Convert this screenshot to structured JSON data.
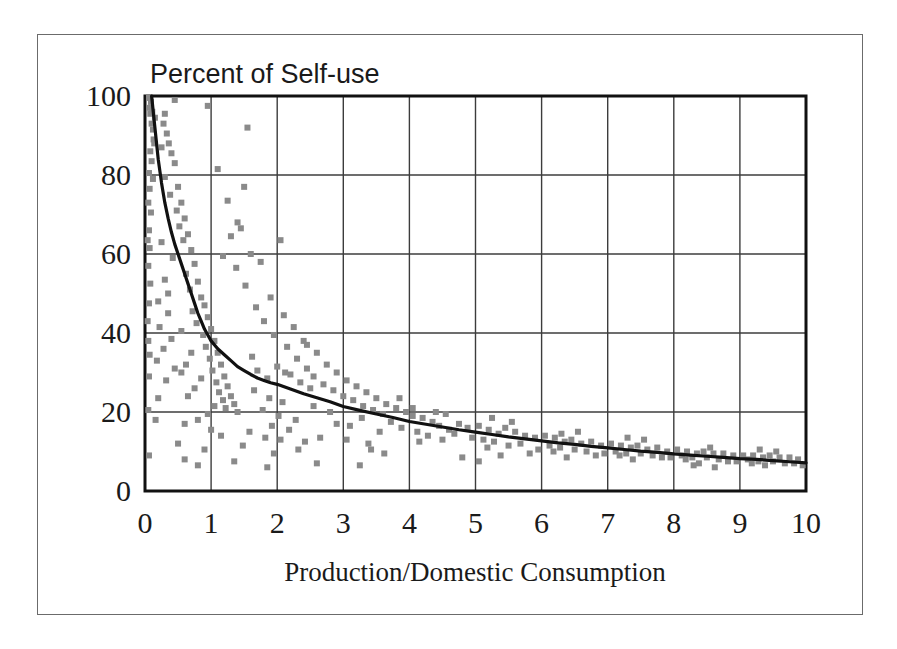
{
  "figure": {
    "background_color": "#ffffff",
    "frame_color": "#6b6b6b"
  },
  "chart_data": {
    "type": "scatter",
    "title": "Percent of Self-use",
    "xlabel": "Production/Domestic Consumption",
    "ylabel": "",
    "xlim": [
      0,
      10
    ],
    "ylim": [
      0,
      100
    ],
    "xticks": [
      "0",
      "1",
      "2",
      "3",
      "4",
      "5",
      "6",
      "7",
      "8",
      "9",
      "10"
    ],
    "yticks": [
      "0",
      "20",
      "40",
      "60",
      "80",
      "100"
    ],
    "grid": true,
    "legend": "none",
    "marker": {
      "shape": "square",
      "color": "#8a8a8a",
      "size_px": 6
    },
    "fit_curve": {
      "label": "power-law fit",
      "color": "#111111",
      "width_px": 3.2,
      "description": "Percent = 100 when Production/Domestic Consumption is near 0.1, decreasing to about 7 at 10",
      "points": [
        [
          0.1,
          100.0
        ],
        [
          0.15,
          92.0
        ],
        [
          0.2,
          84.0
        ],
        [
          0.25,
          78.0
        ],
        [
          0.3,
          73.0
        ],
        [
          0.35,
          69.0
        ],
        [
          0.4,
          65.5
        ],
        [
          0.45,
          62.5
        ],
        [
          0.5,
          60.0
        ],
        [
          0.55,
          57.5
        ],
        [
          0.6,
          55.0
        ],
        [
          0.65,
          52.5
        ],
        [
          0.7,
          50.0
        ],
        [
          0.75,
          47.5
        ],
        [
          0.8,
          45.0
        ],
        [
          0.85,
          43.0
        ],
        [
          0.9,
          41.0
        ],
        [
          0.95,
          39.5
        ],
        [
          1.0,
          38.0
        ],
        [
          1.1,
          36.0
        ],
        [
          1.2,
          34.5
        ],
        [
          1.3,
          33.0
        ],
        [
          1.4,
          31.5
        ],
        [
          1.5,
          30.5
        ],
        [
          1.6,
          29.5
        ],
        [
          1.7,
          28.6
        ],
        [
          1.8,
          28.0
        ],
        [
          1.9,
          27.4
        ],
        [
          2.0,
          27.0
        ],
        [
          2.2,
          25.8
        ],
        [
          2.4,
          24.6
        ],
        [
          2.6,
          23.6
        ],
        [
          2.8,
          22.6
        ],
        [
          3.0,
          21.4
        ],
        [
          3.25,
          20.4
        ],
        [
          3.5,
          19.5
        ],
        [
          3.75,
          18.6
        ],
        [
          4.0,
          17.6
        ],
        [
          4.25,
          16.9
        ],
        [
          4.5,
          16.2
        ],
        [
          4.75,
          15.5
        ],
        [
          5.0,
          14.9
        ],
        [
          5.25,
          14.3
        ],
        [
          5.5,
          13.7
        ],
        [
          5.75,
          13.2
        ],
        [
          6.0,
          12.7
        ],
        [
          6.25,
          12.2
        ],
        [
          6.5,
          11.8
        ],
        [
          6.75,
          11.3
        ],
        [
          7.0,
          10.9
        ],
        [
          7.25,
          10.5
        ],
        [
          7.5,
          10.1
        ],
        [
          7.75,
          9.8
        ],
        [
          8.0,
          9.4
        ],
        [
          8.25,
          9.1
        ],
        [
          8.5,
          8.8
        ],
        [
          8.75,
          8.5
        ],
        [
          9.0,
          8.2
        ],
        [
          9.25,
          8.0
        ],
        [
          9.5,
          7.7
        ],
        [
          9.75,
          7.4
        ],
        [
          10.0,
          7.1
        ]
      ]
    },
    "points": [
      [
        0.06,
        99.5
      ],
      [
        0.07,
        97.0
      ],
      [
        0.08,
        95.5
      ],
      [
        0.09,
        98.5
      ],
      [
        0.1,
        93.0
      ],
      [
        0.11,
        96.0
      ],
      [
        0.12,
        91.5
      ],
      [
        0.13,
        89.0
      ],
      [
        0.08,
        86.0
      ],
      [
        0.14,
        88.0
      ],
      [
        0.1,
        83.5
      ],
      [
        0.06,
        80.5
      ],
      [
        0.12,
        79.0
      ],
      [
        0.07,
        76.5
      ],
      [
        0.05,
        73.0
      ],
      [
        0.09,
        70.5
      ],
      [
        0.06,
        66.0
      ],
      [
        0.04,
        63.5
      ],
      [
        0.07,
        61.5
      ],
      [
        0.05,
        57.0
      ],
      [
        0.08,
        52.5
      ],
      [
        0.06,
        47.5
      ],
      [
        0.04,
        43.0
      ],
      [
        0.05,
        38.0
      ],
      [
        0.07,
        34.5
      ],
      [
        0.06,
        29.0
      ],
      [
        0.05,
        20.5
      ],
      [
        0.06,
        9.0
      ],
      [
        0.3,
        95.5
      ],
      [
        0.28,
        93.0
      ],
      [
        0.33,
        90.5
      ],
      [
        0.36,
        88.0
      ],
      [
        0.25,
        87.0
      ],
      [
        0.4,
        85.5
      ],
      [
        0.45,
        83.0
      ],
      [
        0.3,
        79.5
      ],
      [
        0.5,
        77.0
      ],
      [
        0.38,
        75.0
      ],
      [
        0.55,
        73.0
      ],
      [
        0.48,
        71.0
      ],
      [
        0.6,
        69.0
      ],
      [
        0.52,
        67.0
      ],
      [
        0.65,
        65.0
      ],
      [
        0.58,
        63.5
      ],
      [
        0.7,
        61.0
      ],
      [
        0.42,
        59.0
      ],
      [
        0.75,
        57.5
      ],
      [
        0.62,
        55.0
      ],
      [
        0.8,
        53.0
      ],
      [
        0.68,
        51.0
      ],
      [
        0.85,
        49.0
      ],
      [
        0.9,
        47.0
      ],
      [
        0.72,
        45.5
      ],
      [
        0.95,
        44.0
      ],
      [
        0.78,
        42.5
      ],
      [
        1.0,
        41.0
      ],
      [
        0.88,
        39.5
      ],
      [
        1.05,
        38.0
      ],
      [
        0.92,
        36.5
      ],
      [
        1.1,
        35.0
      ],
      [
        0.98,
        33.5
      ],
      [
        1.15,
        32.0
      ],
      [
        1.02,
        30.5
      ],
      [
        1.2,
        29.0
      ],
      [
        1.08,
        27.5
      ],
      [
        1.25,
        26.5
      ],
      [
        1.12,
        25.0
      ],
      [
        1.3,
        24.0
      ],
      [
        1.18,
        23.0
      ],
      [
        1.35,
        22.0
      ],
      [
        1.22,
        21.0
      ],
      [
        1.4,
        20.0
      ],
      [
        0.7,
        35.0
      ],
      [
        0.62,
        32.0
      ],
      [
        0.55,
        30.0
      ],
      [
        0.85,
        28.5
      ],
      [
        0.75,
        26.0
      ],
      [
        0.65,
        24.0
      ],
      [
        1.05,
        21.5
      ],
      [
        0.95,
        19.5
      ],
      [
        0.8,
        18.0
      ],
      [
        0.6,
        17.0
      ],
      [
        1.0,
        15.5
      ],
      [
        1.15,
        14.0
      ],
      [
        0.5,
        12.0
      ],
      [
        0.9,
        10.5
      ],
      [
        0.25,
        63.0
      ],
      [
        0.3,
        53.5
      ],
      [
        0.2,
        48.0
      ],
      [
        0.35,
        45.0
      ],
      [
        0.22,
        41.5
      ],
      [
        0.4,
        38.5
      ],
      [
        0.28,
        36.0
      ],
      [
        0.18,
        33.0
      ],
      [
        0.45,
        31.0
      ],
      [
        0.32,
        28.0
      ],
      [
        0.2,
        23.5
      ],
      [
        0.16,
        18.0
      ],
      [
        0.95,
        97.5
      ],
      [
        1.55,
        92.0
      ],
      [
        1.1,
        81.5
      ],
      [
        1.5,
        77.0
      ],
      [
        1.25,
        73.5
      ],
      [
        1.45,
        66.5
      ],
      [
        1.3,
        64.5
      ],
      [
        1.18,
        59.5
      ],
      [
        1.6,
        60.0
      ],
      [
        1.75,
        58.0
      ],
      [
        1.38,
        56.5
      ],
      [
        2.05,
        63.5
      ],
      [
        1.52,
        52.0
      ],
      [
        1.9,
        49.0
      ],
      [
        1.68,
        46.5
      ],
      [
        2.1,
        44.5
      ],
      [
        1.8,
        43.0
      ],
      [
        2.25,
        41.5
      ],
      [
        1.95,
        39.5
      ],
      [
        2.4,
        38.0
      ],
      [
        2.15,
        36.5
      ],
      [
        2.6,
        35.0
      ],
      [
        2.3,
        33.5
      ],
      [
        2.75,
        32.0
      ],
      [
        2.45,
        31.0
      ],
      [
        2.9,
        30.0
      ],
      [
        2.55,
        29.0
      ],
      [
        3.05,
        28.0
      ],
      [
        2.7,
        27.0
      ],
      [
        3.2,
        26.5
      ],
      [
        2.85,
        25.5
      ],
      [
        3.35,
        25.0
      ],
      [
        3.0,
        24.0
      ],
      [
        3.5,
        23.5
      ],
      [
        3.15,
        23.0
      ],
      [
        3.65,
        22.0
      ],
      [
        3.3,
        21.5
      ],
      [
        3.8,
        21.0
      ],
      [
        3.45,
        20.5
      ],
      [
        3.95,
        20.0
      ],
      [
        3.6,
        19.5
      ],
      [
        1.7,
        30.5
      ],
      [
        1.85,
        28.5
      ],
      [
        2.0,
        31.5
      ],
      [
        2.2,
        29.5
      ],
      [
        1.65,
        25.5
      ],
      [
        1.88,
        23.5
      ],
      [
        2.08,
        22.5
      ],
      [
        2.35,
        27.5
      ],
      [
        2.5,
        26.0
      ],
      [
        1.78,
        20.5
      ],
      [
        2.02,
        19.0
      ],
      [
        2.28,
        18.0
      ],
      [
        1.92,
        16.5
      ],
      [
        2.18,
        15.5
      ],
      [
        2.55,
        21.5
      ],
      [
        2.8,
        20.0
      ],
      [
        1.58,
        15.0
      ],
      [
        1.82,
        13.5
      ],
      [
        2.05,
        13.0
      ],
      [
        2.42,
        12.5
      ],
      [
        2.65,
        13.5
      ],
      [
        1.48,
        11.5
      ],
      [
        1.95,
        9.5
      ],
      [
        2.32,
        10.5
      ],
      [
        2.9,
        17.0
      ],
      [
        3.1,
        16.5
      ],
      [
        3.28,
        18.5
      ],
      [
        3.05,
        13.0
      ],
      [
        3.38,
        12.0
      ],
      [
        3.55,
        15.0
      ],
      [
        3.72,
        17.5
      ],
      [
        3.88,
        16.0
      ],
      [
        3.42,
        10.5
      ],
      [
        3.62,
        9.5
      ],
      [
        4.05,
        19.0
      ],
      [
        4.2,
        18.5
      ],
      [
        4.35,
        17.5
      ],
      [
        4.12,
        15.0
      ],
      [
        4.28,
        14.0
      ],
      [
        4.45,
        16.5
      ],
      [
        4.6,
        15.5
      ],
      [
        4.15,
        12.5
      ],
      [
        4.5,
        13.0
      ],
      [
        4.75,
        17.0
      ],
      [
        4.88,
        16.0
      ],
      [
        4.68,
        14.5
      ],
      [
        4.95,
        13.5
      ],
      [
        4.4,
        20.0
      ],
      [
        4.05,
        21.0
      ],
      [
        5.05,
        16.5
      ],
      [
        5.2,
        15.5
      ],
      [
        5.35,
        14.5
      ],
      [
        5.12,
        13.0
      ],
      [
        5.28,
        12.5
      ],
      [
        5.45,
        16.0
      ],
      [
        5.6,
        15.0
      ],
      [
        5.18,
        11.0
      ],
      [
        5.5,
        11.5
      ],
      [
        5.75,
        14.0
      ],
      [
        5.9,
        13.5
      ],
      [
        5.68,
        12.0
      ],
      [
        5.95,
        10.5
      ],
      [
        5.38,
        9.0
      ],
      [
        5.82,
        9.5
      ],
      [
        5.25,
        18.5
      ],
      [
        5.55,
        17.5
      ],
      [
        6.05,
        14.0
      ],
      [
        6.2,
        13.5
      ],
      [
        6.35,
        12.5
      ],
      [
        6.12,
        11.5
      ],
      [
        6.28,
        11.0
      ],
      [
        6.45,
        13.0
      ],
      [
        6.6,
        12.0
      ],
      [
        6.18,
        10.0
      ],
      [
        6.5,
        10.5
      ],
      [
        6.75,
        12.5
      ],
      [
        6.9,
        11.5
      ],
      [
        6.68,
        10.0
      ],
      [
        6.95,
        9.5
      ],
      [
        6.38,
        8.5
      ],
      [
        6.82,
        9.0
      ],
      [
        6.55,
        15.0
      ],
      [
        6.3,
        14.5
      ],
      [
        7.05,
        12.0
      ],
      [
        7.2,
        11.5
      ],
      [
        7.35,
        11.0
      ],
      [
        7.12,
        10.0
      ],
      [
        7.28,
        9.5
      ],
      [
        7.45,
        11.5
      ],
      [
        7.6,
        10.5
      ],
      [
        7.18,
        9.0
      ],
      [
        7.5,
        9.5
      ],
      [
        7.75,
        11.0
      ],
      [
        7.9,
        10.0
      ],
      [
        7.68,
        9.0
      ],
      [
        7.95,
        8.5
      ],
      [
        7.38,
        8.0
      ],
      [
        7.82,
        8.5
      ],
      [
        7.55,
        13.0
      ],
      [
        7.3,
        13.5
      ],
      [
        8.05,
        10.5
      ],
      [
        8.2,
        10.0
      ],
      [
        8.35,
        9.5
      ],
      [
        8.12,
        9.0
      ],
      [
        8.28,
        8.5
      ],
      [
        8.45,
        10.0
      ],
      [
        8.6,
        9.5
      ],
      [
        8.18,
        8.0
      ],
      [
        8.5,
        8.5
      ],
      [
        8.75,
        9.5
      ],
      [
        8.9,
        9.0
      ],
      [
        8.68,
        8.0
      ],
      [
        8.95,
        7.5
      ],
      [
        8.38,
        7.0
      ],
      [
        8.82,
        7.5
      ],
      [
        8.55,
        11.0
      ],
      [
        8.3,
        6.5
      ],
      [
        8.62,
        6.0
      ],
      [
        9.05,
        9.0
      ],
      [
        9.2,
        9.0
      ],
      [
        9.35,
        8.5
      ],
      [
        9.12,
        8.0
      ],
      [
        9.28,
        7.5
      ],
      [
        9.45,
        9.0
      ],
      [
        9.6,
        8.5
      ],
      [
        9.18,
        7.0
      ],
      [
        9.5,
        7.5
      ],
      [
        9.75,
        8.5
      ],
      [
        9.88,
        8.0
      ],
      [
        9.68,
        7.0
      ],
      [
        9.95,
        6.5
      ],
      [
        9.38,
        6.5
      ],
      [
        9.82,
        7.0
      ],
      [
        9.55,
        10.0
      ],
      [
        9.3,
        10.5
      ],
      [
        0.8,
        6.5
      ],
      [
        1.85,
        6.0
      ],
      [
        2.6,
        7.0
      ],
      [
        3.25,
        6.5
      ],
      [
        0.6,
        8.0
      ],
      [
        1.35,
        7.5
      ],
      [
        4.8,
        8.5
      ],
      [
        5.05,
        7.5
      ],
      [
        0.45,
        99.0
      ],
      [
        0.15,
        94.5
      ],
      [
        1.4,
        68.0
      ],
      [
        2.45,
        37.0
      ],
      [
        3.85,
        23.5
      ],
      [
        4.55,
        19.5
      ],
      [
        0.35,
        50.0
      ],
      [
        0.55,
        40.5
      ],
      [
        1.62,
        34.0
      ],
      [
        2.12,
        30.0
      ]
    ]
  }
}
